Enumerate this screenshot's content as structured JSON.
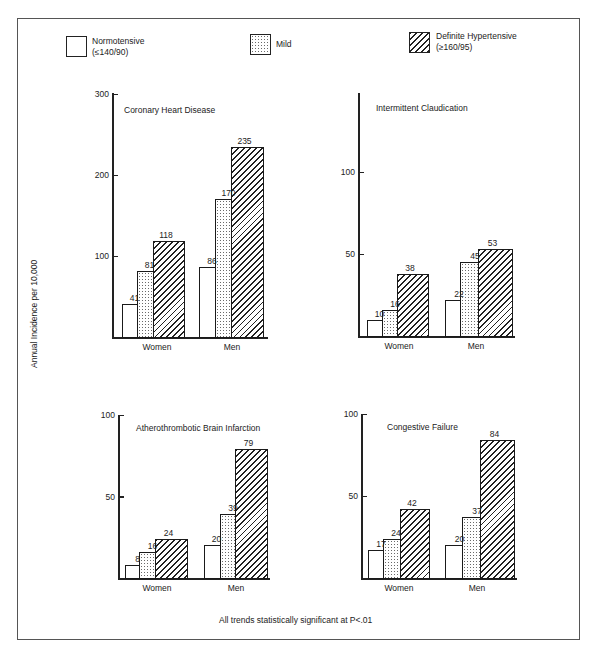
{
  "legend": {
    "items": [
      {
        "key": "normo",
        "label": "Normotensive",
        "sublabel": "(≤140/90)"
      },
      {
        "key": "mild",
        "label": "Mild",
        "sublabel": ""
      },
      {
        "key": "hyper",
        "label": "Definite Hypertensive",
        "sublabel": "(≥160/95)"
      }
    ]
  },
  "ylabel": "Annual Incidence per 10,000",
  "footnote": "All trends statistically significant at P<.01",
  "chart_data": [
    {
      "type": "bar",
      "title": "Coronary Heart Disease",
      "categories": [
        "Women",
        "Men"
      ],
      "series": [
        {
          "name": "Normotensive (≤140/90)",
          "values": [
            41,
            86
          ]
        },
        {
          "name": "Mild",
          "values": [
            81,
            170
          ]
        },
        {
          "name": "Definite Hypertensive (≥160/95)",
          "values": [
            118,
            235
          ]
        }
      ],
      "xlabel": "",
      "ylabel": "Annual Incidence per 10,000",
      "yticks": [
        100,
        200,
        300
      ],
      "ylim": [
        0,
        300
      ],
      "grid": false,
      "legend_position": "top"
    },
    {
      "type": "bar",
      "title": "Intermittent Claudication",
      "categories": [
        "Women",
        "Men"
      ],
      "series": [
        {
          "name": "Normotensive (≤140/90)",
          "values": [
            10,
            22
          ]
        },
        {
          "name": "Mild",
          "values": [
            16,
            45
          ]
        },
        {
          "name": "Definite Hypertensive (≥160/95)",
          "values": [
            38,
            53
          ]
        }
      ],
      "xlabel": "",
      "ylabel": "Annual Incidence per 10,000",
      "yticks": [
        50,
        100
      ],
      "ylim": [
        0,
        150
      ],
      "grid": false,
      "legend_position": "top"
    },
    {
      "type": "bar",
      "title": "Atherothrombotic Brain Infarction",
      "categories": [
        "Women",
        "Men"
      ],
      "series": [
        {
          "name": "Normotensive (≤140/90)",
          "values": [
            8,
            20
          ]
        },
        {
          "name": "Mild",
          "values": [
            16,
            39
          ]
        },
        {
          "name": "Definite Hypertensive (≥160/95)",
          "values": [
            24,
            79
          ]
        }
      ],
      "xlabel": "",
      "ylabel": "Annual Incidence per 10,000",
      "yticks": [
        50,
        100
      ],
      "ylim": [
        0,
        100
      ],
      "grid": false,
      "legend_position": "top"
    },
    {
      "type": "bar",
      "title": "Congestive Failure",
      "categories": [
        "Women",
        "Men"
      ],
      "series": [
        {
          "name": "Normotensive (≤140/90)",
          "values": [
            17,
            20
          ]
        },
        {
          "name": "Mild",
          "values": [
            24,
            37
          ]
        },
        {
          "name": "Definite Hypertensive (≥160/95)",
          "values": [
            42,
            84
          ]
        }
      ],
      "xlabel": "",
      "ylabel": "Annual Incidence per 10,000",
      "yticks": [
        50,
        100
      ],
      "ylim": [
        0,
        100
      ],
      "grid": false,
      "legend_position": "top"
    }
  ]
}
